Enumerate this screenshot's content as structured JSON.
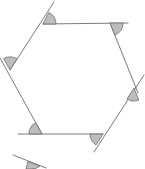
{
  "diagram": {
    "shape": "hexagon",
    "colors": {
      "line": "#6b6b6b",
      "angle_fill": "#bdbdbd",
      "background": "#ffffff"
    },
    "vertices": [
      {
        "id": "top-left",
        "x": 43,
        "y": 24
      },
      {
        "id": "top-right",
        "x": 110,
        "y": 23
      },
      {
        "id": "right",
        "x": 134,
        "y": 88
      },
      {
        "id": "bottom-right",
        "x": 103,
        "y": 134
      },
      {
        "id": "bottom-left",
        "x": 42,
        "y": 134
      },
      {
        "id": "left",
        "x": 10,
        "y": 70
      }
    ],
    "exterior_angles_count": 6,
    "partial_shape_fragment": true
  }
}
